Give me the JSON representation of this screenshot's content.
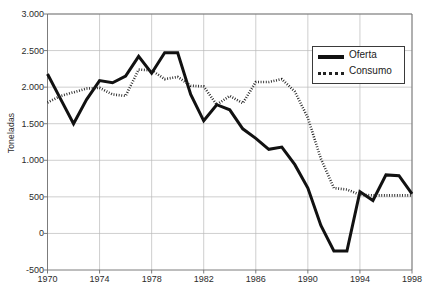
{
  "chart_data": {
    "type": "line",
    "title": "",
    "xlabel": "",
    "ylabel": "Toneladas",
    "xlim": [
      1970,
      1998
    ],
    "ylim": [
      -500,
      3000
    ],
    "ytick_values": [
      3000,
      2500,
      2000,
      1500,
      1000,
      500,
      0,
      -500
    ],
    "ytick_labels": [
      "3.000",
      "2.500",
      "2.000",
      "1.500",
      "1.000",
      "500",
      "0",
      "-500"
    ],
    "xtick_values": [
      1970,
      1974,
      1978,
      1982,
      1986,
      1990,
      1994,
      1998
    ],
    "xtick_labels": [
      "1970",
      "1974",
      "1978",
      "1982",
      "1986",
      "1990",
      "1994",
      "1998"
    ],
    "grid": true,
    "legend_position": "top-right",
    "x": [
      1970,
      1971,
      1972,
      1973,
      1974,
      1975,
      1976,
      1977,
      1978,
      1979,
      1980,
      1981,
      1982,
      1983,
      1984,
      1985,
      1986,
      1987,
      1988,
      1989,
      1990,
      1991,
      1992,
      1993,
      1994,
      1995,
      1996,
      1997,
      1998
    ],
    "series": [
      {
        "name": "Oferta",
        "style": "solid",
        "color": "#111111",
        "values": [
          2180,
          1840,
          1500,
          1830,
          2090,
          2060,
          2150,
          2420,
          2190,
          2470,
          2470,
          1900,
          1540,
          1760,
          1690,
          1430,
          1300,
          1150,
          1180,
          940,
          620,
          110,
          -240,
          -240,
          570,
          450,
          800,
          790,
          540
        ]
      },
      {
        "name": "Consumo",
        "style": "dotted",
        "color": "#222222",
        "values": [
          1790,
          1880,
          1930,
          1980,
          1990,
          1900,
          1880,
          2240,
          2230,
          2110,
          2140,
          2020,
          2010,
          1760,
          1880,
          1780,
          2070,
          2070,
          2110,
          1940,
          1580,
          1020,
          620,
          600,
          530,
          520,
          520,
          520,
          520
        ]
      }
    ]
  },
  "legend": {
    "items": [
      {
        "label": "Oferta"
      },
      {
        "label": "Consumo"
      }
    ]
  }
}
